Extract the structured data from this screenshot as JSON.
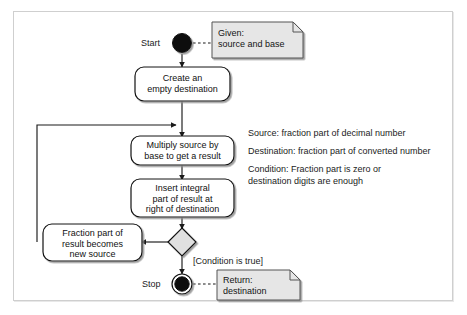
{
  "diagram": {
    "frame_color": "#cfcfcf",
    "line_color": "#1a1a1a",
    "note_fill": "#e6e6e6",
    "node_fill": "#ffffff",
    "decision_fill": "#e0e0e0",
    "shadow_color": "#9a9a9a"
  },
  "labels": {
    "start": "Start",
    "stop": "Stop",
    "condition_guard": "[Condition is true]"
  },
  "nodes": {
    "start_node": "start-filled-circle",
    "stop_node": "final-circle",
    "decision": "decision-diamond",
    "action1": "Create an\nempty destination",
    "action2": "Multiply source by\nbase to get a result",
    "action3": "Insert integral\npart of result at\nright of destination",
    "action4": "Fraction part of\nresult becomes\nnew source"
  },
  "notes": {
    "given": "Given:\nsource and base",
    "return": "Return:\ndestination"
  },
  "legend": {
    "line1": "Source: fraction part of decimal number",
    "line2": "Destination: fraction part of converted number",
    "line3": "Condition: Fraction part is zero or\ndestination digits are enough"
  }
}
